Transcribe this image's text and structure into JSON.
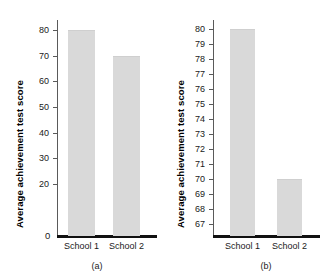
{
  "figure": {
    "background": "#ffffff",
    "bar_color": "#d9d9d9",
    "axis_color": "#5a5a5a",
    "baseline_color": "#111111"
  },
  "panels": [
    {
      "key": "a",
      "caption": "(a)",
      "ylabel": "Average achievement test score",
      "zero_label": "0",
      "chart_data": {
        "type": "bar",
        "title": "",
        "xlabel": "",
        "ylabel": "Average achievement test score",
        "categories": [
          "School 1",
          "School 2"
        ],
        "values": [
          80,
          70
        ],
        "ylim": [
          0,
          84
        ],
        "yticks": [
          20,
          30,
          40,
          50,
          60,
          70,
          80
        ],
        "ytick_labels": [
          "20",
          "30",
          "40",
          "50",
          "60",
          "70",
          "80"
        ],
        "grid": false,
        "legend": "none",
        "annotations": [
          "(a)"
        ]
      }
    },
    {
      "key": "b",
      "caption": "(b)",
      "ylabel": "Average achievement test score",
      "zero_label": "",
      "chart_data": {
        "type": "bar",
        "title": "",
        "xlabel": "",
        "ylabel": "Average achievement test score",
        "categories": [
          "School 1",
          "School 2"
        ],
        "values": [
          80,
          70
        ],
        "ylim": [
          66.3,
          80.6
        ],
        "yticks": [
          67,
          68,
          69,
          70,
          71,
          72,
          73,
          74,
          75,
          76,
          77,
          78,
          79,
          80
        ],
        "ytick_labels": [
          "67",
          "68",
          "69",
          "70",
          "71",
          "72",
          "73",
          "74",
          "75",
          "76",
          "77",
          "78",
          "79",
          "80"
        ],
        "grid": false,
        "legend": "none",
        "annotations": [
          "(b)"
        ]
      }
    }
  ]
}
